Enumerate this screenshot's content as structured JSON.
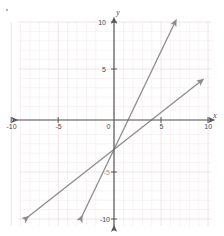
{
  "chart_data": {
    "type": "line",
    "title": "",
    "xlabel": "x",
    "ylabel": "y",
    "xlim": [
      -10,
      10
    ],
    "ylim": [
      -10,
      10
    ],
    "grid": true,
    "legend": "none",
    "x_ticks": [
      -10,
      -5,
      5,
      10
    ],
    "y_ticks": [
      10,
      5,
      -5,
      -10
    ],
    "x_tick_labels": [
      "-10",
      "-5",
      "5",
      "10"
    ],
    "y_tick_labels": [
      "10",
      "5",
      "-5",
      "-10"
    ],
    "origin_label": "0",
    "series": [
      {
        "name": "steep-line",
        "equation": "y = 2x - 3",
        "slope": 2,
        "intercept": -3,
        "x_intercept": 1.5,
        "color": "#8c8c8c",
        "arrows": "both",
        "points": [
          [
            -3.5,
            -10
          ],
          [
            6.5,
            10
          ]
        ]
      },
      {
        "name": "shallow-line",
        "equation": "y = 0.75x - 3",
        "slope": 0.75,
        "intercept": -3,
        "x_intercept": 4,
        "color": "#8c8c8c",
        "arrows": "both",
        "points": [
          [
            -9.3,
            -10
          ],
          [
            9.3,
            4
          ]
        ]
      }
    ],
    "intersection": [
      0,
      -3
    ]
  },
  "axes": {
    "x_axis_name": "x",
    "y_axis_name": "y",
    "origin": "0",
    "x_labels": {
      "neg_ten": "-10",
      "neg_five": "-5",
      "pos_five": "5",
      "pos_ten": "10"
    },
    "y_labels": {
      "pos_ten": "10",
      "pos_five": "5",
      "neg_five": "-5",
      "neg_ten": "-10"
    }
  },
  "colors": {
    "grid": "#f0e4e6",
    "grid_major": "#e8dadd",
    "axis": "#595959",
    "line": "#8c8c8c",
    "label": "#4a4a4a",
    "background": "#ffffff"
  }
}
